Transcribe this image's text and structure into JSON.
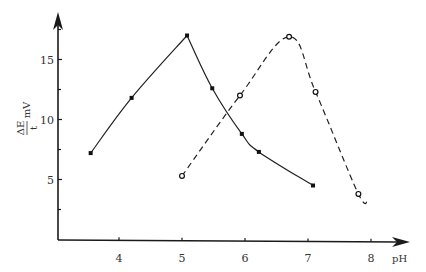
{
  "chart_data": {
    "type": "line",
    "title": "",
    "xlabel": "pH",
    "ylabel_numerator": "ΔE",
    "ylabel_denominator": "t",
    "ylabel_unit": "mV",
    "xlim": [
      3.0,
      8.5
    ],
    "ylim": [
      0,
      18.5
    ],
    "x_ticks": [
      4,
      5,
      6,
      7,
      8
    ],
    "x_tick_labels": [
      "4",
      "5",
      "6",
      "7",
      "8"
    ],
    "y_major_ticks": [
      5,
      10,
      15
    ],
    "y_tick_labels": [
      "5",
      "10",
      "15"
    ],
    "y_minor_ticks": [
      2.5,
      7.5,
      12.5
    ],
    "grid": false,
    "legend": "none",
    "series": [
      {
        "name": "solid",
        "style": "solid",
        "marker": "filled-square",
        "x": [
          3.55,
          4.2,
          5.08,
          5.48,
          5.95,
          6.22,
          7.08
        ],
        "y": [
          7.2,
          11.8,
          17.0,
          12.6,
          8.8,
          7.3,
          4.5
        ]
      },
      {
        "name": "dashed",
        "style": "dashed",
        "marker": "open-circle",
        "x": [
          5.0,
          5.92,
          6.7,
          7.12,
          7.8
        ],
        "y": [
          5.3,
          12.0,
          16.9,
          12.3,
          3.8
        ],
        "tail": [
          7.95,
          3.4
        ]
      }
    ]
  }
}
